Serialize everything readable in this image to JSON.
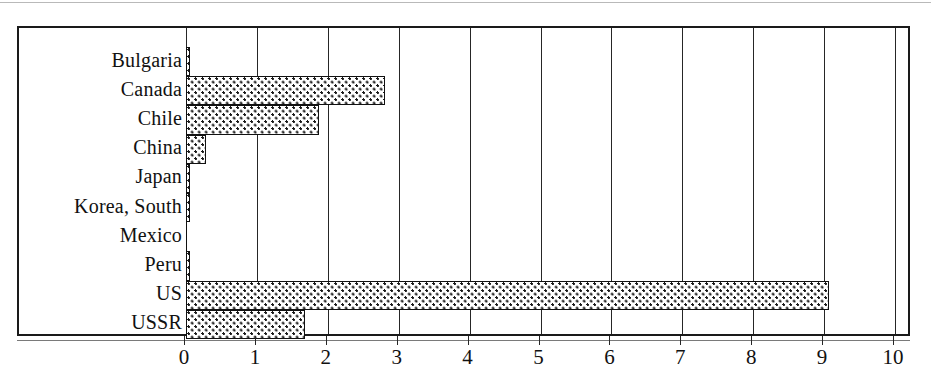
{
  "chart_data": {
    "type": "bar",
    "orientation": "horizontal",
    "title": "",
    "subtitle": "",
    "xlabel": "",
    "ylabel": "",
    "xlim": [
      0,
      10
    ],
    "xticks": [
      0,
      1,
      2,
      3,
      4,
      5,
      6,
      7,
      8,
      9,
      10
    ],
    "xticklabels": [
      "0",
      "1",
      "2",
      "3",
      "4",
      "5",
      "6",
      "7",
      "8",
      "9",
      "10"
    ],
    "grid": true,
    "grid_axis": "x",
    "legend": false,
    "legend_position": "none",
    "categories": [
      "Bulgaria",
      "Canada",
      "Chile",
      "China",
      "Japan",
      "Korea, South",
      "Mexico",
      "Peru",
      "US",
      "USSR"
    ],
    "values": [
      0.05,
      2.81,
      1.88,
      0.28,
      0.02,
      0.02,
      0.0,
      0.05,
      9.07,
      1.68
    ],
    "series": [
      {
        "name": "",
        "values": [
          0.05,
          2.81,
          1.88,
          0.28,
          0.02,
          0.02,
          0.0,
          0.05,
          9.07,
          1.68
        ]
      }
    ],
    "bar_fill": "checkerboard-dot-pattern",
    "bar_edge_color": "#111111",
    "bar_face_color": "#ffffff",
    "axes_color": "#1a1a1a"
  },
  "style": {
    "background": "#ffffff",
    "text_color": "#111111",
    "gridline_color": "#262626"
  }
}
